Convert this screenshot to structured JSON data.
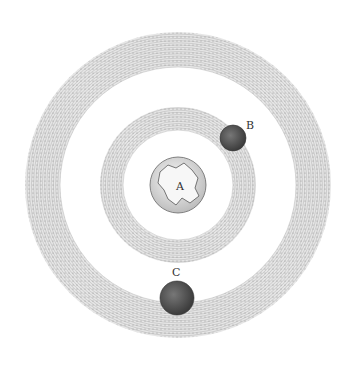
{
  "diagram": {
    "center": [
      178,
      185
    ],
    "rings": [
      {
        "name": "outer-orbit",
        "outer_r": 153,
        "inner_r": 118
      },
      {
        "name": "inner-orbit",
        "outer_r": 78,
        "inner_r": 55
      }
    ],
    "globe": {
      "label": "A",
      "r": 28
    },
    "bodies": [
      {
        "label": "B",
        "cx": 233,
        "cy": 138,
        "r": 13,
        "label_x": 246,
        "label_y": 129
      },
      {
        "label": "C",
        "cx": 177,
        "cy": 298,
        "r": 17,
        "label_x": 172,
        "label_y": 276
      }
    ],
    "colors": {
      "ink": "#555555",
      "ring_fill": "#dcdcdc",
      "body": "#5a5a5a",
      "globe": "#eeeeee"
    }
  }
}
